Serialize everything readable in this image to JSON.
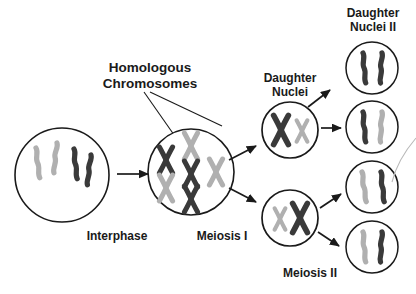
{
  "figure": {
    "title_absent": "",
    "background_color": "#ffffff",
    "colors": {
      "dark_chromosome": "#3a3a3a",
      "light_chromosome": "#b0b0b0",
      "outline": "#1a1a1a",
      "text": "#1a1a1a",
      "stray_line": "#b9b9b9"
    }
  },
  "labels": {
    "homologous_chromosomes_line1": "Homologous",
    "homologous_chromosomes_line2": "Chromosomes",
    "daughter_nuclei_line1": "Daughter",
    "daughter_nuclei_line2": "Nuclei",
    "daughter_nuclei_ii_line1": "Daughter",
    "daughter_nuclei_ii_line2": "Nuclei II",
    "interphase": "Interphase",
    "meiosis_i": "Meiosis I",
    "meiosis_ii": "Meiosis II"
  },
  "cells": {
    "interphase": {
      "name": "Interphase",
      "chromosome_count": 4,
      "chromosome_shape": "squiggle",
      "chromosome_colors": [
        "#b0b0b0",
        "#b0b0b0",
        "#3a3a3a",
        "#3a3a3a"
      ]
    },
    "meiosis_i": {
      "name": "Meiosis I",
      "chromosome_count": 6,
      "chromosome_shape": "x-shaped",
      "chromosome_colors": [
        "#3a3a3a",
        "#b0b0b0",
        "#b0b0b0",
        "#3a3a3a",
        "#3a3a3a",
        "#b0b0b0"
      ]
    },
    "daughter_nucleus_top": {
      "name": "Daughter Nucleus Top",
      "chromosome_count": 2,
      "chromosome_shape": "x-shaped",
      "chromosome_colors": [
        "#3a3a3a",
        "#b0b0b0"
      ]
    },
    "daughter_nucleus_bottom": {
      "name": "Daughter Nucleus Bottom",
      "chromosome_count": 2,
      "chromosome_shape": "x-shaped",
      "chromosome_colors": [
        "#b0b0b0",
        "#3a3a3a"
      ]
    },
    "daughter_nuclei_ii": [
      {
        "name": "Daughter Nucleus II-1",
        "chromosome_count": 2,
        "chromosome_shape": "squiggle",
        "chromosome_colors": [
          "#3a3a3a",
          "#3a3a3a"
        ]
      },
      {
        "name": "Daughter Nucleus II-2",
        "chromosome_count": 2,
        "chromosome_shape": "squiggle",
        "chromosome_colors": [
          "#3a3a3a",
          "#b0b0b0"
        ]
      },
      {
        "name": "Daughter Nucleus II-3",
        "chromosome_count": 2,
        "chromosome_shape": "squiggle",
        "chromosome_colors": [
          "#b0b0b0",
          "#3a3a3a"
        ]
      },
      {
        "name": "Daughter Nucleus II-4",
        "chromosome_count": 2,
        "chromosome_shape": "squiggle",
        "chromosome_colors": [
          "#b0b0b0",
          "#3a3a3a"
        ]
      }
    ]
  },
  "arrows": [
    {
      "name": "interphase-to-meiosis-i",
      "style": "straight"
    },
    {
      "name": "meiosis-i-to-daughter-top",
      "style": "diagonal-up"
    },
    {
      "name": "meiosis-i-to-daughter-bottom",
      "style": "diagonal-down"
    },
    {
      "name": "daughter-top-to-nucleus-1",
      "style": "diagonal-up"
    },
    {
      "name": "daughter-top-to-nucleus-2",
      "style": "straight"
    },
    {
      "name": "daughter-bottom-to-nucleus-3",
      "style": "straight"
    },
    {
      "name": "daughter-bottom-to-nucleus-4",
      "style": "diagonal-down"
    }
  ]
}
